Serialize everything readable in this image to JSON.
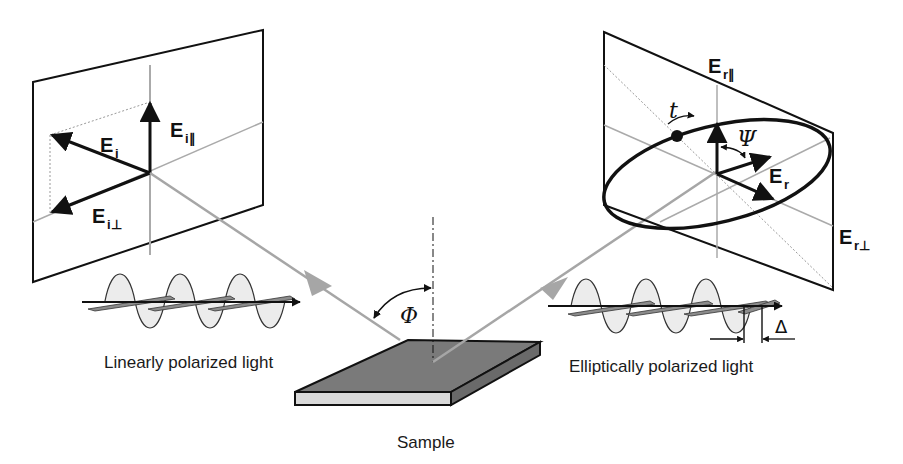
{
  "diagram": {
    "incident_plane": {
      "vector_total": "E",
      "vector_total_sub": "i",
      "vector_parallel": "E",
      "vector_parallel_sub": "i∥",
      "vector_perp": "E",
      "vector_perp_sub": "i⊥"
    },
    "reflected_plane": {
      "vector_total": "E",
      "vector_total_sub": "r",
      "vector_parallel": "E",
      "vector_parallel_sub": "r∥",
      "vector_perp": "E",
      "vector_perp_sub": "r⊥",
      "time_label": "t",
      "angle_label": "Ψ"
    },
    "incidence_angle_label": "Φ",
    "phase_label": "Δ",
    "captions": {
      "incident_wave": "Linearly polarized light",
      "reflected_wave": "Elliptically polarized light",
      "sample": "Sample"
    },
    "colors": {
      "beam": "#a6a6a6",
      "sample_top": "#7a7a7a",
      "sample_side": "#d9d9d9",
      "frame": "#111111",
      "wave_fill": "#ececec",
      "wave_blade": "#8c8c8c"
    }
  }
}
